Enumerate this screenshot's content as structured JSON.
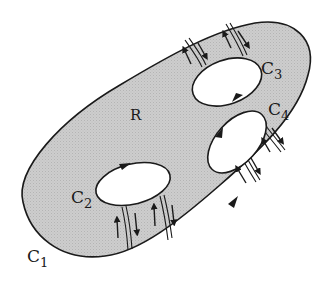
{
  "diagram": {
    "colors": {
      "region_fill": "#c9c9c9",
      "stroke": "#1a1a1a",
      "hole_fill": "#ffffff",
      "background": "#ffffff"
    },
    "labels": {
      "region": "R",
      "outer_curve": {
        "main": "C",
        "sub": "1"
      },
      "hole_left": {
        "main": "C",
        "sub": "2"
      },
      "hole_top": {
        "main": "C",
        "sub": "3"
      },
      "hole_right": {
        "main": "C",
        "sub": "4"
      }
    },
    "curves": [
      {
        "name": "C1",
        "role": "outer boundary",
        "orientation": "counterclockwise"
      },
      {
        "name": "C2",
        "role": "inner boundary",
        "orientation": "clockwise"
      },
      {
        "name": "C3",
        "role": "inner boundary",
        "orientation": "clockwise"
      },
      {
        "name": "C4",
        "role": "inner boundary",
        "orientation": "clockwise"
      }
    ],
    "cuts": [
      {
        "from": "C1",
        "to": "C2",
        "arrows": [
          "up",
          "down"
        ]
      },
      {
        "from": "C2",
        "to": "C1",
        "arrows": [
          "up",
          "down"
        ]
      },
      {
        "from": "C1",
        "to": "C3",
        "arrows": [
          "up",
          "down"
        ]
      },
      {
        "from": "C3",
        "to": "C1",
        "arrows": [
          "up",
          "down"
        ]
      },
      {
        "from": "C4",
        "to": "C1",
        "arrows": [
          "up",
          "down"
        ]
      },
      {
        "from": "C4",
        "to": "C1",
        "arrows": [
          "up",
          "down"
        ]
      }
    ]
  }
}
